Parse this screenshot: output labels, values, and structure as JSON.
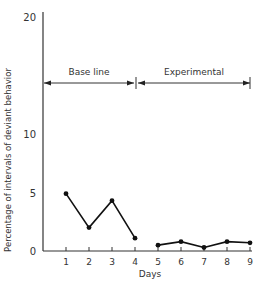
{
  "chart_data": {
    "type": "line",
    "title": "",
    "xlabel": "Days",
    "ylabel": "Percentage of intervals of deviant behavior",
    "ylim": [
      0,
      20
    ],
    "yticks": [
      0,
      5,
      10,
      20
    ],
    "xticks": [
      1,
      2,
      3,
      4,
      5,
      6,
      7,
      8,
      9
    ],
    "grid": false,
    "legend": null,
    "phases": [
      {
        "name": "Base line",
        "from_day": 0,
        "to_day": 4
      },
      {
        "name": "Experimental",
        "from_day": 4,
        "to_day": 9
      }
    ],
    "series": [
      {
        "name": "Base line",
        "x": [
          1,
          2,
          3,
          4
        ],
        "values": [
          4.9,
          2.0,
          4.3,
          1.1
        ]
      },
      {
        "name": "Experimental",
        "x": [
          5,
          6,
          7,
          8,
          9
        ],
        "values": [
          0.5,
          0.8,
          0.3,
          0.8,
          0.7
        ]
      }
    ]
  }
}
